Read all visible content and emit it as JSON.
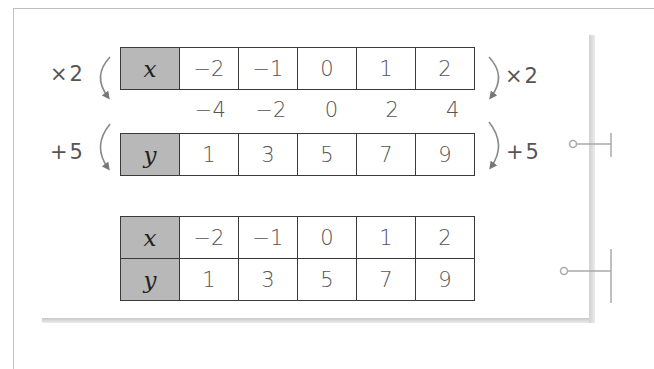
{
  "figure": {
    "step_table": {
      "x_row": {
        "label": "x",
        "values": [
          "−2",
          "−1",
          "0",
          "1",
          "2"
        ]
      },
      "intermediate_values": [
        "−4",
        "−2",
        "0",
        "2",
        "4"
      ],
      "y_row": {
        "label": "y",
        "values": [
          "1",
          "3",
          "5",
          "7",
          "9"
        ]
      },
      "operations": {
        "left_first": "×2",
        "left_second": "+5",
        "right_first": "×2",
        "right_second": "+5"
      }
    },
    "summary_table": {
      "x_row": {
        "label": "x",
        "values": [
          "−2",
          "−1",
          "0",
          "1",
          "2"
        ]
      },
      "y_row": {
        "label": "y",
        "values": [
          "1",
          "3",
          "5",
          "7",
          "9"
        ]
      }
    }
  }
}
